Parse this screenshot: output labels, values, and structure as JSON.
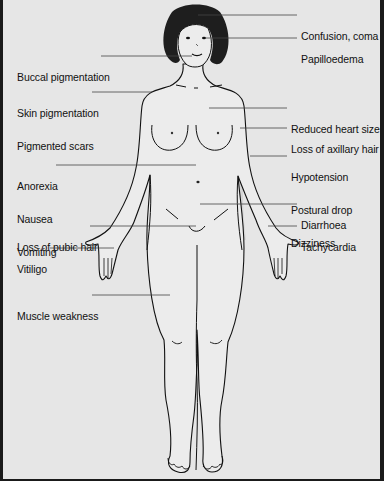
{
  "diagram": {
    "colors": {
      "background": "#e6e6e6",
      "body_fill": "#ececec",
      "outline": "#111111",
      "hair": "#1e1e1e",
      "leader_line": "#444444",
      "border": "#1a1a1a"
    },
    "labels_left": [
      {
        "id": "buccal",
        "lines": [
          "Buccal pigmentation"
        ]
      },
      {
        "id": "skin",
        "lines": [
          "Skin pigmentation",
          "Pigmented scars"
        ]
      },
      {
        "id": "gi",
        "lines": [
          "Anorexia",
          "Nausea",
          "Vomiting"
        ]
      },
      {
        "id": "pubic",
        "lines": [
          "Loss of pubic hair"
        ]
      },
      {
        "id": "vitiligo",
        "lines": [
          "Vitiligo"
        ]
      },
      {
        "id": "muscle",
        "lines": [
          "Muscle weakness"
        ]
      }
    ],
    "labels_right": [
      {
        "id": "confusion",
        "lines": [
          "Confusion, coma"
        ]
      },
      {
        "id": "papilloedema",
        "lines": [
          "Papilloedema"
        ]
      },
      {
        "id": "heart",
        "lines": [
          "Reduced heart size"
        ]
      },
      {
        "id": "axillary",
        "lines": [
          "Loss of axillary hair"
        ]
      },
      {
        "id": "bp",
        "lines": [
          "Hypotension",
          "Postural drop",
          "Dizziness"
        ]
      },
      {
        "id": "diarrhoea",
        "lines": [
          "Diarrhoea"
        ]
      },
      {
        "id": "tachy",
        "lines": [
          "Tachycardia"
        ]
      }
    ]
  }
}
